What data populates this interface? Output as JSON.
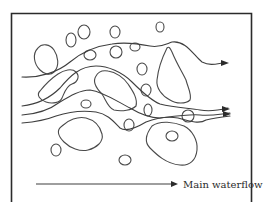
{
  "diagram": {
    "title": "",
    "legend": {
      "label": "Main waterflow",
      "symbol": "arrow-right"
    },
    "colors": {
      "background": "#ffffff",
      "stroke": "#3f3f3f",
      "frame": "#2b2b2b"
    },
    "elements": {
      "grains_large": 6,
      "grains_small": 16,
      "flow_paths": 5,
      "arrowheads": 3
    }
  }
}
